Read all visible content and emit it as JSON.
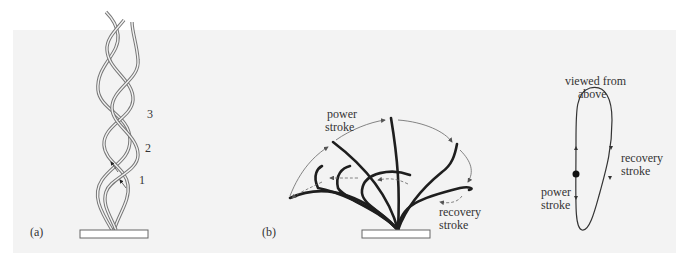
{
  "figure": {
    "panel_a": {
      "label": "(a)",
      "numbers": [
        "1",
        "2",
        "3"
      ]
    },
    "panel_b": {
      "label": "(b)",
      "power_stroke": [
        "power",
        "stroke"
      ],
      "recovery_stroke": [
        "recovery",
        "stroke"
      ]
    },
    "panel_c": {
      "title": [
        "viewed from",
        "above"
      ],
      "recovery_stroke": [
        "recovery",
        "stroke"
      ],
      "power_stroke": [
        "power",
        "stroke"
      ]
    },
    "colors": {
      "background_panel": "#f3f3f3",
      "cilium_dark": "#1e1e1e",
      "outline": "#555555"
    }
  }
}
